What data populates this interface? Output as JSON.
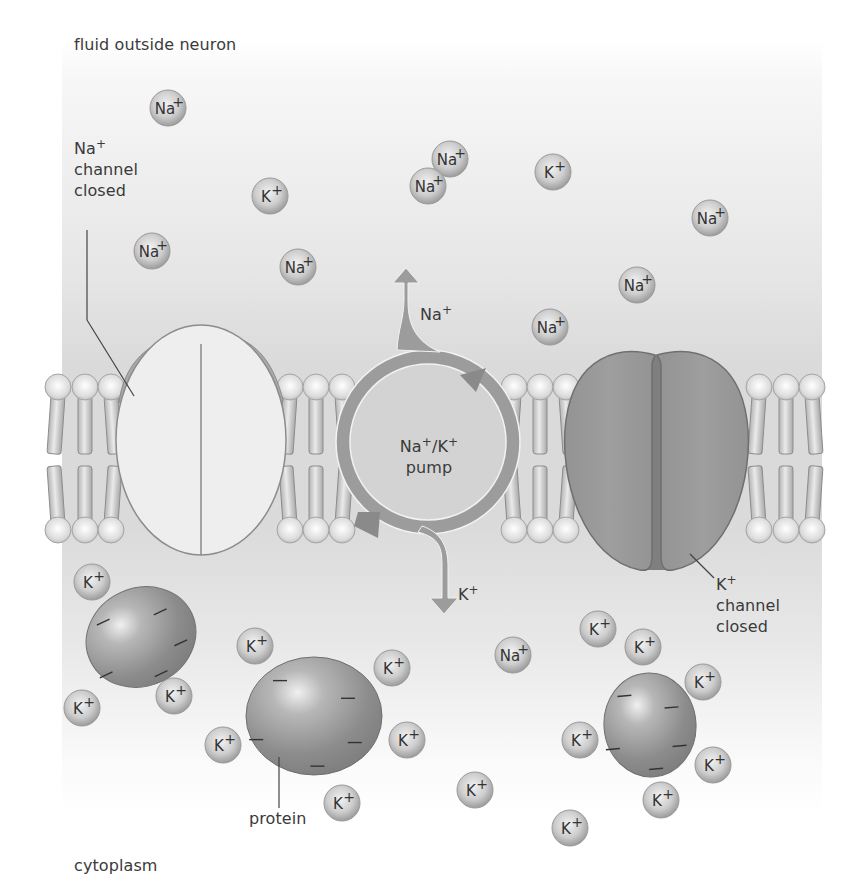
{
  "diagram": {
    "regions": {
      "outside_label": "fluid outside neuron",
      "inside_label": "cytoplasm"
    },
    "labels": {
      "na_channel": {
        "ion": "Na",
        "charge": "+",
        "line1": "channel",
        "line2": "closed"
      },
      "k_channel": {
        "ion": "K",
        "charge": "+",
        "line1": "channel",
        "line2": "closed"
      },
      "pump": {
        "line1": "Na",
        "sep": "/K",
        "line2": "pump",
        "charge": "+"
      },
      "pump_out_ion": {
        "ion": "Na",
        "charge": "+"
      },
      "pump_in_ion": {
        "ion": "K",
        "charge": "+"
      },
      "protein": "protein"
    },
    "ions_outside": [
      {
        "ion": "Na",
        "x": 168,
        "y": 108
      },
      {
        "ion": "K",
        "x": 270,
        "y": 196
      },
      {
        "ion": "Na",
        "x": 152,
        "y": 251
      },
      {
        "ion": "Na",
        "x": 298,
        "y": 267
      },
      {
        "ion": "Na",
        "x": 450,
        "y": 159
      },
      {
        "ion": "Na",
        "x": 428,
        "y": 186
      },
      {
        "ion": "K",
        "x": 553,
        "y": 172
      },
      {
        "ion": "Na",
        "x": 710,
        "y": 218
      },
      {
        "ion": "Na",
        "x": 637,
        "y": 285
      },
      {
        "ion": "Na",
        "x": 550,
        "y": 327
      }
    ],
    "ions_inside": [
      {
        "ion": "K",
        "x": 92,
        "y": 582
      },
      {
        "ion": "K",
        "x": 82,
        "y": 708
      },
      {
        "ion": "K",
        "x": 174,
        "y": 696
      },
      {
        "ion": "K",
        "x": 255,
        "y": 646
      },
      {
        "ion": "K",
        "x": 392,
        "y": 668
      },
      {
        "ion": "K",
        "x": 223,
        "y": 745
      },
      {
        "ion": "K",
        "x": 407,
        "y": 740
      },
      {
        "ion": "K",
        "x": 342,
        "y": 803
      },
      {
        "ion": "Na",
        "x": 513,
        "y": 655
      },
      {
        "ion": "K",
        "x": 598,
        "y": 629
      },
      {
        "ion": "K",
        "x": 643,
        "y": 647
      },
      {
        "ion": "K",
        "x": 703,
        "y": 682
      },
      {
        "ion": "K",
        "x": 580,
        "y": 740
      },
      {
        "ion": "K",
        "x": 713,
        "y": 765
      },
      {
        "ion": "K",
        "x": 661,
        "y": 800
      },
      {
        "ion": "K",
        "x": 475,
        "y": 790
      },
      {
        "ion": "K",
        "x": 570,
        "y": 828
      }
    ],
    "proteins": [
      {
        "cx": 141,
        "cy": 637,
        "rx": 56,
        "ry": 49,
        "rot": -25
      },
      {
        "cx": 314,
        "cy": 716,
        "rx": 68,
        "ry": 59,
        "rot": 0
      },
      {
        "cx": 650,
        "cy": 725,
        "rx": 46,
        "ry": 52,
        "rot": -5
      }
    ],
    "colors": {
      "background_top": "#f6f6f6",
      "background_band": "#d9d9d9",
      "na_channel_fill": "#eeeeee",
      "na_channel_cap": "#a8a8a8",
      "k_channel_fill": "#9a9a9a",
      "pump_arrow": "#9c9c9c",
      "pump_fill": "#d2d2d2",
      "ion_fill": "#c4c4c4",
      "protein_fill": "#8e8e8e",
      "text": "#3a3a3a"
    }
  }
}
